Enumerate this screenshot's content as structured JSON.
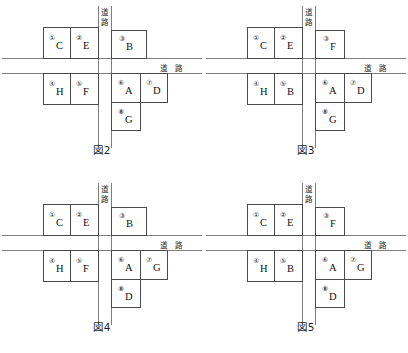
{
  "page": {
    "road_label_vertical": "道路",
    "road_label_vertical_chars": [
      "道",
      "路"
    ],
    "road_label_horizontal": "道 路"
  },
  "figures": [
    {
      "id": "fig2",
      "caption": "図2",
      "road_v": "道路",
      "road_h": "道 路",
      "plots": [
        {
          "num": "①",
          "letter": "C"
        },
        {
          "num": "②",
          "letter": "E"
        },
        {
          "num": "③",
          "letter": "B"
        },
        {
          "num": "④",
          "letter": "H"
        },
        {
          "num": "⑤",
          "letter": "F"
        },
        {
          "num": "⑥",
          "letter": "A"
        },
        {
          "num": "⑦",
          "letter": "D"
        },
        {
          "num": "⑧",
          "letter": "G"
        }
      ]
    },
    {
      "id": "fig3",
      "caption": "図3",
      "road_v": "道路",
      "road_h": "道 路",
      "plots": [
        {
          "num": "①",
          "letter": "C"
        },
        {
          "num": "②",
          "letter": "E"
        },
        {
          "num": "③",
          "letter": "F"
        },
        {
          "num": "④",
          "letter": "H"
        },
        {
          "num": "⑤",
          "letter": "B"
        },
        {
          "num": "⑥",
          "letter": "A"
        },
        {
          "num": "⑦",
          "letter": "D"
        },
        {
          "num": "⑧",
          "letter": "G"
        }
      ]
    },
    {
      "id": "fig4",
      "caption": "図4",
      "road_v": "道路",
      "road_h": "道 路",
      "plots": [
        {
          "num": "①",
          "letter": "C"
        },
        {
          "num": "②",
          "letter": "E"
        },
        {
          "num": "③",
          "letter": "B"
        },
        {
          "num": "④",
          "letter": "H"
        },
        {
          "num": "⑤",
          "letter": "F"
        },
        {
          "num": "⑥",
          "letter": "A"
        },
        {
          "num": "⑦",
          "letter": "G"
        },
        {
          "num": "⑧",
          "letter": "D"
        }
      ]
    },
    {
      "id": "fig5",
      "caption": "図5",
      "road_v": "道路",
      "road_h": "道 路",
      "plots": [
        {
          "num": "①",
          "letter": "C"
        },
        {
          "num": "②",
          "letter": "E"
        },
        {
          "num": "③",
          "letter": "F"
        },
        {
          "num": "④",
          "letter": "H"
        },
        {
          "num": "⑤",
          "letter": "B"
        },
        {
          "num": "⑥",
          "letter": "A"
        },
        {
          "num": "⑦",
          "letter": "G"
        },
        {
          "num": "⑧",
          "letter": "D"
        }
      ]
    }
  ]
}
